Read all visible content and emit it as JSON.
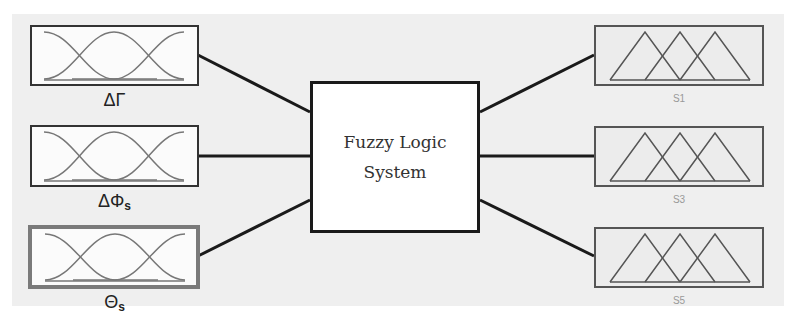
{
  "diagram": {
    "title": "Fuzzy Logic System",
    "center": {
      "line1": "Fuzzy Logic",
      "line2": "System"
    },
    "inputs": [
      {
        "label_main": "ΔΓ",
        "label_sub": "",
        "mf_shape": "gaussian",
        "mf_count": 3,
        "highlighted": false
      },
      {
        "label_main": "ΔΦ",
        "label_sub": "s",
        "mf_shape": "gaussian",
        "mf_count": 3,
        "highlighted": false
      },
      {
        "label_main": "Θ",
        "label_sub": "s",
        "mf_shape": "gaussian",
        "mf_count": 3,
        "highlighted": true
      }
    ],
    "outputs": [
      {
        "label": "S1",
        "mf_shape": "triangular",
        "mf_count": 3
      },
      {
        "label": "S3",
        "mf_shape": "triangular",
        "mf_count": 3
      },
      {
        "label": "S5",
        "mf_shape": "triangular",
        "mf_count": 3
      }
    ],
    "colors": {
      "line": "#1a1a1a",
      "curve": "#777777",
      "background": "#efefef",
      "highlight_border": "#7a7a7a"
    }
  }
}
